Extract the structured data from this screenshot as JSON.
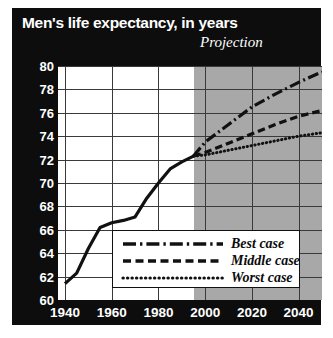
{
  "chart_title": "Men's life expectancy, in years",
  "projection_label": "Projection",
  "axes": {
    "y_ticks": [
      "80",
      "78",
      "76",
      "74",
      "72",
      "70",
      "68",
      "66",
      "64",
      "62",
      "60"
    ],
    "x_ticks": [
      "1940",
      "1960",
      "1980",
      "2000",
      "2020",
      "2040"
    ]
  },
  "legend": {
    "best": "Best case",
    "middle": "Middle case",
    "worst": "Worst case"
  },
  "colors": {
    "panel": "#0d0d0d",
    "plot_background": "#ffffff",
    "projection_band": "#a8a8a8",
    "gridline": "#3a3a3a",
    "series": "#111111",
    "tick_text": "#ffffff"
  },
  "chart_data": {
    "type": "line",
    "title": "Men's life expectancy, in years",
    "xlabel": "",
    "ylabel": "Years",
    "xlim": [
      1937,
      2050
    ],
    "ylim": [
      60,
      80
    ],
    "y_tick_step": 2,
    "x_tick_step": 20,
    "grid": true,
    "legend_position": "lower-center",
    "annotations": [
      {
        "text": "Projection",
        "x": 2015,
        "y": 80.8,
        "style": "italic"
      }
    ],
    "shaded_region": {
      "label": "Projection",
      "x_start": 1995,
      "x_end": 2050,
      "color": "#a8a8a8"
    },
    "series": [
      {
        "name": "Historical",
        "style": "solid",
        "x": [
          1940,
          1945,
          1950,
          1955,
          1960,
          1965,
          1970,
          1975,
          1980,
          1985,
          1990,
          1995
        ],
        "values": [
          61.4,
          62.3,
          64.4,
          66.2,
          66.6,
          66.8,
          67.1,
          68.7,
          70.0,
          71.2,
          71.8,
          72.3
        ]
      },
      {
        "name": "Best case",
        "style": "dash-dot",
        "x": [
          1995,
          2000,
          2010,
          2020,
          2030,
          2040,
          2050
        ],
        "values": [
          72.3,
          73.5,
          75.0,
          76.5,
          77.6,
          78.6,
          79.5
        ]
      },
      {
        "name": "Middle case",
        "style": "dashed",
        "x": [
          1995,
          2000,
          2010,
          2020,
          2030,
          2040,
          2050
        ],
        "values": [
          72.3,
          72.6,
          73.4,
          74.2,
          75.0,
          75.7,
          76.2
        ]
      },
      {
        "name": "Worst case",
        "style": "dotted",
        "x": [
          1995,
          2000,
          2010,
          2020,
          2030,
          2040,
          2050
        ],
        "values": [
          72.3,
          72.4,
          72.8,
          73.2,
          73.6,
          74.0,
          74.3
        ]
      }
    ]
  }
}
